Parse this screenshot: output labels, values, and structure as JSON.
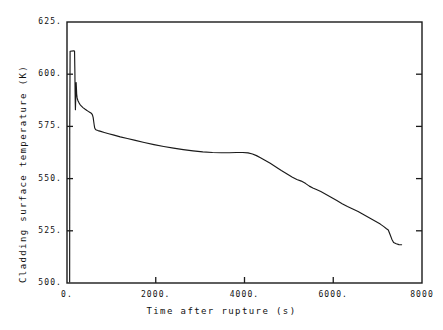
{
  "chart_data": {
    "type": "line",
    "title": "",
    "xlabel": "Time after rupture (s)",
    "ylabel": "Cladding surface temperature (K)",
    "xlim": [
      0,
      8000
    ],
    "ylim": [
      500,
      625
    ],
    "xticks": [
      0,
      2000,
      4000,
      6000,
      8000
    ],
    "xtick_labels": [
      "0.",
      "2000.",
      "4000.",
      "6000.",
      "8000"
    ],
    "yticks": [
      500,
      525,
      550,
      575,
      600,
      625
    ],
    "ytick_labels": [
      "500.",
      "525.",
      "550.",
      "575.",
      "600.",
      "625."
    ],
    "grid": false,
    "legend": null,
    "line_color": "#1a1a1a",
    "frame_color": "#1a1a1a",
    "series": [
      {
        "name": "Cladding surface temperature",
        "x": [
          60,
          62,
          70,
          150,
          170,
          178,
          182,
          186,
          190,
          196,
          200,
          206,
          212,
          218,
          226,
          236,
          250,
          268,
          290,
          320,
          360,
          410,
          450,
          480,
          510,
          540,
          560,
          575,
          590,
          600,
          612,
          625,
          640,
          660,
          700,
          760,
          840,
          940,
          1060,
          1200,
          1360,
          1540,
          1740,
          1960,
          2180,
          2400,
          2620,
          2840,
          3060,
          3280,
          3480,
          3660,
          3820,
          3960,
          4080,
          4180,
          4270,
          4360,
          4460,
          4580,
          4700,
          4830,
          4960,
          5080,
          5180,
          5280,
          5380,
          5460,
          5540,
          5620,
          5720,
          5840,
          5960,
          6080,
          6200,
          6320,
          6440,
          6560,
          6660,
          6760,
          6860,
          6960,
          7060,
          7140,
          7200,
          7240,
          7280,
          7320,
          7360,
          7420,
          7480,
          7540
        ],
        "y": [
          500.5,
          575.0,
          611.0,
          611.2,
          611.1,
          600.5,
          592.0,
          586.5,
          583.0,
          588.0,
          594.5,
          596.0,
          593.5,
          590.5,
          589.0,
          588.0,
          587.2,
          586.4,
          585.6,
          584.8,
          584.0,
          583.2,
          582.6,
          582.2,
          581.8,
          581.4,
          581.0,
          580.4,
          579.2,
          577.6,
          575.8,
          574.2,
          573.6,
          573.3,
          573.0,
          572.6,
          572.1,
          571.5,
          570.8,
          570.0,
          569.2,
          568.3,
          567.3,
          566.3,
          565.4,
          564.6,
          563.9,
          563.3,
          562.8,
          562.5,
          562.4,
          562.4,
          562.5,
          562.5,
          562.3,
          561.8,
          561.0,
          560.0,
          558.8,
          557.3,
          555.7,
          553.9,
          552.2,
          550.7,
          549.6,
          548.8,
          547.6,
          546.4,
          545.5,
          544.8,
          543.8,
          542.4,
          541.0,
          539.5,
          538.0,
          536.6,
          535.4,
          534.2,
          533.0,
          531.8,
          530.6,
          529.4,
          528.2,
          527.0,
          526.0,
          525.4,
          523.2,
          521.0,
          519.4,
          518.8,
          518.4,
          518.3
        ]
      }
    ]
  }
}
